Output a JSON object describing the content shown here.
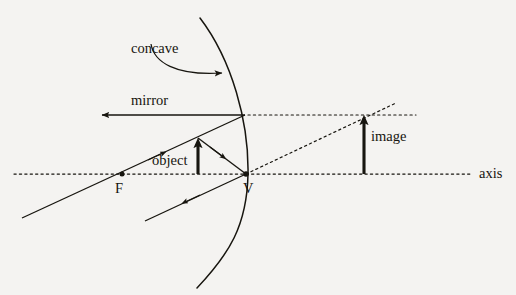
{
  "figure": {
    "kind": "ray-diagram",
    "background_color": "#f4f3f1",
    "ink_color": "#17150f"
  },
  "labels": {
    "concave_mirror_line1": "concave",
    "concave_mirror_line2": "mirror",
    "object": "object",
    "image": "image",
    "axis": "axis",
    "focal_point": "F",
    "vertex": "V"
  },
  "geometry": {
    "axis": {
      "y": 174,
      "x_start": 14,
      "x_end": 470,
      "style": "dotted"
    },
    "mirror_arc": {
      "top": [
        200,
        18
      ],
      "vertex": [
        248,
        174
      ],
      "bottom": [
        197,
        288
      ],
      "style": "solid curve, concave toward left"
    },
    "focal_point": {
      "x": 122,
      "y": 174
    },
    "vertex_point": {
      "x": 245,
      "y": 174
    },
    "object_arrow": {
      "x": 198,
      "base_y": 174,
      "tip_y": 138,
      "direction": "up"
    },
    "image_arrow": {
      "x": 364,
      "base_y": 174,
      "tip_y": 115,
      "direction": "up"
    },
    "reflected_parallel_ray": {
      "from": [
        245,
        115
      ],
      "to": [
        100,
        115
      ],
      "arrow_at": "left end"
    },
    "dotted_extension_horizontal": {
      "from": [
        248,
        115
      ],
      "to": [
        415,
        115
      ]
    },
    "dotted_extension_oblique": {
      "from": [
        246,
        174
      ],
      "to": [
        395,
        104
      ]
    },
    "incident_ray_through_F": {
      "from": [
        22,
        218
      ],
      "to": [
        245,
        115
      ],
      "arrow_at": [
        160,
        155
      ]
    },
    "ray_object_tip_to_vertex": {
      "from": [
        198,
        138
      ],
      "to": [
        246,
        174
      ],
      "arrow_at": [
        222,
        156
      ]
    },
    "reflected_ray_down_left": {
      "from": [
        246,
        174
      ],
      "to": [
        145,
        221
      ],
      "arrow_at": [
        186,
        203
      ]
    },
    "pointer_curve": {
      "from": [
        152,
        46
      ],
      "to": [
        226,
        74
      ],
      "arrow_at": "end",
      "style": "curved"
    }
  }
}
